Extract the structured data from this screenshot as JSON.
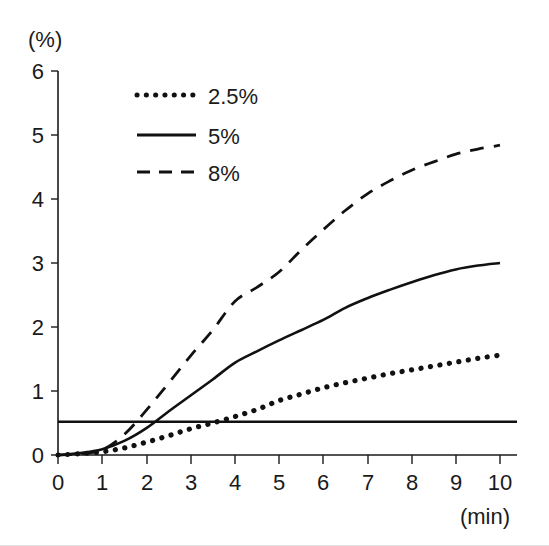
{
  "chart": {
    "type": "line",
    "y_unit_label": "(%)",
    "x_unit_label": "(min)",
    "xlabel": "",
    "ylabel": "",
    "title": "",
    "xlim": [
      0,
      10
    ],
    "ylim": [
      0,
      6
    ],
    "grid": false,
    "legend_position": "upper-left-inside",
    "x_ticks": [
      "0",
      "1",
      "2",
      "3",
      "4",
      "5",
      "6",
      "7",
      "8",
      "9",
      "10"
    ],
    "y_ticks": [
      "0",
      "1",
      "2",
      "3",
      "4",
      "5",
      "6"
    ],
    "line_color": "#111111",
    "axis_color": "#1a1a1a"
  },
  "chart_data": {
    "type": "line",
    "title": "",
    "xlabel": "(min)",
    "ylabel": "(%)",
    "xlim": [
      0,
      10
    ],
    "ylim": [
      0,
      6
    ],
    "grid": false,
    "legend_position": "upper-left-inside",
    "x_tick_labels": [
      "0",
      "1",
      "2",
      "3",
      "4",
      "5",
      "6",
      "7",
      "8",
      "9",
      "10"
    ],
    "y_tick_labels": [
      "0",
      "1",
      "2",
      "3",
      "4",
      "5",
      "6"
    ],
    "x": [
      0,
      0.5,
      1,
      1.5,
      2,
      2.5,
      3,
      3.5,
      4,
      4.5,
      5,
      5.5,
      6,
      6.5,
      7,
      7.5,
      8,
      8.5,
      9,
      9.5,
      10
    ],
    "series": [
      {
        "name": "2.5%",
        "style": "dotted",
        "values": [
          0.0,
          0.02,
          0.05,
          0.11,
          0.2,
          0.3,
          0.41,
          0.5,
          0.6,
          0.71,
          0.85,
          0.95,
          1.05,
          1.13,
          1.2,
          1.27,
          1.33,
          1.39,
          1.45,
          1.51,
          1.56
        ]
      },
      {
        "name": "5%",
        "style": "solid",
        "values": [
          0.0,
          0.03,
          0.09,
          0.22,
          0.42,
          0.68,
          0.93,
          1.18,
          1.44,
          1.62,
          1.79,
          1.95,
          2.11,
          2.3,
          2.45,
          2.58,
          2.7,
          2.81,
          2.9,
          2.96,
          3.0
        ]
      },
      {
        "name": "8%",
        "style": "dashed",
        "values": [
          0.0,
          0.02,
          0.08,
          0.32,
          0.7,
          1.12,
          1.55,
          1.95,
          2.4,
          2.62,
          2.86,
          3.2,
          3.52,
          3.82,
          4.08,
          4.28,
          4.45,
          4.58,
          4.7,
          4.78,
          4.84
        ]
      }
    ],
    "reference_line": {
      "name": "horizontal-reference",
      "orientation": "horizontal",
      "value": 0.52,
      "style": "solid"
    }
  },
  "legend": {
    "items": [
      {
        "label": "2.5%",
        "style": "dotted"
      },
      {
        "label": "5%",
        "style": "solid"
      },
      {
        "label": "8%",
        "style": "dashed"
      }
    ]
  }
}
